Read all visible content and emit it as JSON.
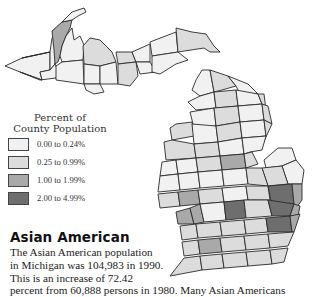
{
  "map": {
    "region": "Michigan",
    "subject": "Asian American percent of county population, 1990"
  },
  "legend": {
    "title_line1": "Percent of",
    "title_line2": "County Population",
    "items": [
      {
        "label": "0.00 to 0.24%",
        "color": "#f1f1f1"
      },
      {
        "label": "0.25 to 0.99%",
        "color": "#dcdcdc"
      },
      {
        "label": "1.00 to 1.99%",
        "color": "#a9a9a9"
      },
      {
        "label": "2.00 to 4.99%",
        "color": "#6e6e6e"
      }
    ]
  },
  "article": {
    "heading": "Asian American",
    "lines": [
      "The Asian American population",
      "in Michigan was 104,983 in 1990.",
      "This is an increase of 72.42",
      "percent from 60,888 persons in 1980. Many Asian Americans"
    ]
  }
}
